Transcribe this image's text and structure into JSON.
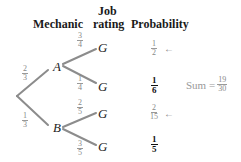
{
  "headers": {
    "mechanic": "Mechanic",
    "job_line1": "Job",
    "job_line2": "rating",
    "probability": "Probability"
  },
  "tree": {
    "root_branches": [
      {
        "node": "A",
        "num": "2",
        "den": "3"
      },
      {
        "node": "B",
        "num": "1",
        "den": "3"
      }
    ],
    "leaves": [
      {
        "parent": "A",
        "label": "G",
        "complement": false,
        "branch_num": "3",
        "branch_den": "4",
        "prob_num": "1",
        "prob_den": "2",
        "arrow": true
      },
      {
        "parent": "A",
        "label": "G",
        "complement": true,
        "branch_num": "1",
        "branch_den": "4",
        "prob_num": "1",
        "prob_den": "6",
        "arrow": false
      },
      {
        "parent": "B",
        "label": "G",
        "complement": false,
        "branch_num": "2",
        "branch_den": "5",
        "prob_num": "2",
        "prob_den": "15",
        "arrow": true
      },
      {
        "parent": "B",
        "label": "G",
        "complement": true,
        "branch_num": "3",
        "branch_den": "5",
        "prob_num": "1",
        "prob_den": "5",
        "arrow": false
      }
    ]
  },
  "sum": {
    "label": "Sum =",
    "num": "19",
    "den": "30"
  },
  "arrow_glyph": "←",
  "colors": {
    "line": "#8c8c8c",
    "text": "#222222",
    "muted": "#999999"
  }
}
